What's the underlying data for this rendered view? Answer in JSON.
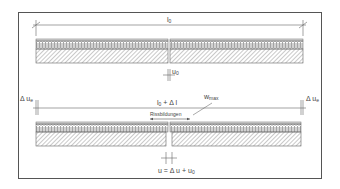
{
  "figure": {
    "type": "technical-diagram",
    "stroke_color": "#555555",
    "background": "#ffffff"
  },
  "top_diagram": {
    "length_label": "l",
    "length_sub": "0",
    "gap_label": "u",
    "gap_sub": "0"
  },
  "bottom_diagram": {
    "length_label": "l",
    "length_sub": "0",
    "length_suffix": " + Δ l",
    "left_delta_label": "Δ u",
    "left_delta_sub": "e",
    "right_delta_label": "Δ u",
    "right_delta_sub": "e",
    "wmax_label": "w",
    "wmax_sub": "max",
    "crack_label": "Rissbildungen",
    "formula_prefix": "u = Δ u + u",
    "formula_sub": "0"
  }
}
